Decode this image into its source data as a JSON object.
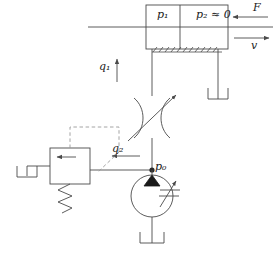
{
  "diagram": {
    "labels": {
      "p1": "p₁",
      "p2": "p₂ ≈ 0",
      "force": "F",
      "velocity": "v",
      "q1": "q₁",
      "q2": "q₂",
      "p0": "p₀"
    },
    "components": {
      "cylinder": "hydraulic-cylinder",
      "piston_rod": "piston-rod",
      "chamber_left": "chamber-p1",
      "chamber_right": "chamber-p2",
      "ground_hatching": "ground-support-hatching",
      "throttle_valve": "variable-throttle-valve",
      "relief_valve": "pressure-relief-valve",
      "relief_spring": "valve-spring",
      "pilot_line": "pilot-control-line",
      "pump": "variable-displacement-pump",
      "junction": "pressure-node-p0",
      "tank_left": "reservoir-tank-left",
      "tank_right": "reservoir-tank-right",
      "tank_bottom": "reservoir-tank-bottom"
    },
    "colors": {
      "line": "#4a4a4a",
      "text": "#1a1a1a",
      "pilot": "#9a9a9a",
      "fill": "#ffffff"
    }
  }
}
